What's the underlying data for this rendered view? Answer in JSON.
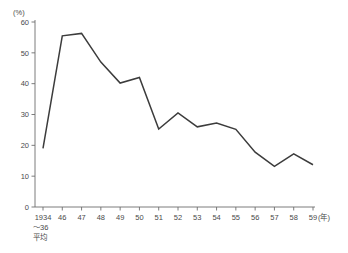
{
  "chart_data": {
    "type": "line",
    "title": "",
    "xlabel": "(年)",
    "ylabel": "(%)",
    "ylim": [
      0,
      60
    ],
    "yticks": [
      0,
      10,
      20,
      30,
      40,
      50,
      60
    ],
    "ytick_labels": [
      "0",
      "10",
      "20",
      "30",
      "40",
      "50",
      "60"
    ],
    "grid": false,
    "legend": "none",
    "categories": [
      "1934",
      "46",
      "47",
      "48",
      "49",
      "50",
      "51",
      "52",
      "53",
      "54",
      "55",
      "56",
      "57",
      "58",
      "59"
    ],
    "x_first_label_lines": [
      "1934",
      "～36",
      "平均"
    ],
    "x_axis_unit": "(年)",
    "y_axis_unit": "(%)",
    "values": [
      19.0,
      55.5,
      56.3,
      47.0,
      40.2,
      42.0,
      25.3,
      30.5,
      26.0,
      27.2,
      25.2,
      17.8,
      13.2,
      17.2,
      13.7
    ],
    "series": [
      {
        "name": "",
        "values": [
          19.0,
          55.5,
          56.3,
          47.0,
          40.2,
          42.0,
          25.3,
          30.5,
          26.0,
          27.2,
          25.2,
          17.8,
          13.2,
          17.2,
          13.7
        ]
      }
    ],
    "line_color": "#3c3c3c",
    "axis_color": "#6e6e6e"
  }
}
